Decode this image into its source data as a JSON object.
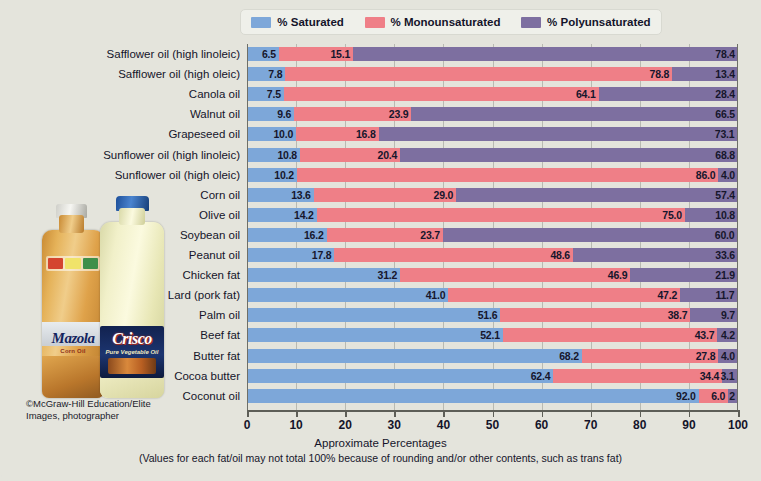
{
  "legend": {
    "items": [
      {
        "label": "% Saturated",
        "color": "#7da7d9",
        "key": "saturated"
      },
      {
        "label": "% Monounsaturated",
        "color": "#ef7f87",
        "key": "monounsaturated"
      },
      {
        "label": "% Polyunsaturated",
        "color": "#7d6fa0",
        "key": "polyunsaturated"
      }
    ]
  },
  "axis": {
    "xlabel": "Approximate Percentages",
    "note": "(Values for each fat/oil may not total 100% because of rounding and/or other contents, such as trans fat)",
    "ticks": [
      "0",
      "10",
      "20",
      "30",
      "40",
      "50",
      "60",
      "70",
      "80",
      "90",
      "100"
    ]
  },
  "credit": "©McGraw-Hill Education/Elite Images, photographer",
  "photo": {
    "bottle_left": {
      "brand": "Mazola",
      "sub": "Corn Oil",
      "cap": "white"
    },
    "bottle_right": {
      "brand": "Crisco",
      "sub": "Pure Vegetable Oil",
      "cap": "blue"
    }
  },
  "chart_data": {
    "type": "bar",
    "orientation": "horizontal",
    "stacked": true,
    "title": "",
    "xlabel": "Approximate Percentages",
    "ylabel": "",
    "xlim": [
      0,
      100
    ],
    "grid": true,
    "legend_position": "top",
    "series": [
      {
        "name": "% Saturated",
        "color": "#7da7d9",
        "values": [
          6.5,
          7.8,
          7.5,
          9.6,
          10.0,
          10.8,
          10.2,
          13.6,
          14.2,
          16.2,
          17.8,
          31.2,
          41.0,
          51.6,
          52.1,
          68.2,
          62.4,
          92.0
        ]
      },
      {
        "name": "% Monounsaturated",
        "color": "#ef7f87",
        "values": [
          15.1,
          78.8,
          64.1,
          23.9,
          16.8,
          20.4,
          86.0,
          29.0,
          75.0,
          23.7,
          48.6,
          46.9,
          47.2,
          38.7,
          43.7,
          27.8,
          34.4,
          6.0
        ]
      },
      {
        "name": "% Polyunsaturated",
        "color": "#7d6fa0",
        "values": [
          78.4,
          13.4,
          28.4,
          66.5,
          73.1,
          68.8,
          4.0,
          57.4,
          10.8,
          60.0,
          33.6,
          21.9,
          11.7,
          9.7,
          4.2,
          4.0,
          3.1,
          2.0
        ]
      }
    ],
    "categories": [
      "Safflower oil (high linoleic)",
      "Safflower oil (high oleic)",
      "Canola oil",
      "Walnut oil",
      "Grapeseed oil",
      "Sunflower oil (high linoleic)",
      "Sunflower oil (high oleic)",
      "Corn oil",
      "Olive oil",
      "Soybean oil",
      "Peanut oil",
      "Chicken fat",
      "Lard (pork fat)",
      "Palm oil",
      "Beef fat",
      "Butter fat",
      "Cocoa butter",
      "Coconut oil"
    ],
    "labels": [
      {
        "saturated": "6.5",
        "monounsaturated": "15.1",
        "polyunsaturated": "78.4"
      },
      {
        "saturated": "7.8",
        "monounsaturated": "78.8",
        "polyunsaturated": "13.4"
      },
      {
        "saturated": "7.5",
        "monounsaturated": "64.1",
        "polyunsaturated": "28.4"
      },
      {
        "saturated": "9.6",
        "monounsaturated": "23.9",
        "polyunsaturated": "66.5"
      },
      {
        "saturated": "10.0",
        "monounsaturated": "16.8",
        "polyunsaturated": "73.1"
      },
      {
        "saturated": "10.8",
        "monounsaturated": "20.4",
        "polyunsaturated": "68.8"
      },
      {
        "saturated": "10.2",
        "monounsaturated": "86.0",
        "polyunsaturated": "4.0"
      },
      {
        "saturated": "13.6",
        "monounsaturated": "29.0",
        "polyunsaturated": "57.4"
      },
      {
        "saturated": "14.2",
        "monounsaturated": "75.0",
        "polyunsaturated": "10.8"
      },
      {
        "saturated": "16.2",
        "monounsaturated": "23.7",
        "polyunsaturated": "60.0"
      },
      {
        "saturated": "17.8",
        "monounsaturated": "48.6",
        "polyunsaturated": "33.6"
      },
      {
        "saturated": "31.2",
        "monounsaturated": "46.9",
        "polyunsaturated": "21.9"
      },
      {
        "saturated": "41.0",
        "monounsaturated": "47.2",
        "polyunsaturated": "11.7"
      },
      {
        "saturated": "51.6",
        "monounsaturated": "38.7",
        "polyunsaturated": "9.7"
      },
      {
        "saturated": "52.1",
        "monounsaturated": "43.7",
        "polyunsaturated": "4.2"
      },
      {
        "saturated": "68.2",
        "monounsaturated": "27.8",
        "polyunsaturated": "4.0"
      },
      {
        "saturated": "62.4",
        "monounsaturated": "34.4",
        "polyunsaturated": "3.1"
      },
      {
        "saturated": "92.0",
        "monounsaturated": "6.0",
        "polyunsaturated": "2"
      }
    ]
  }
}
